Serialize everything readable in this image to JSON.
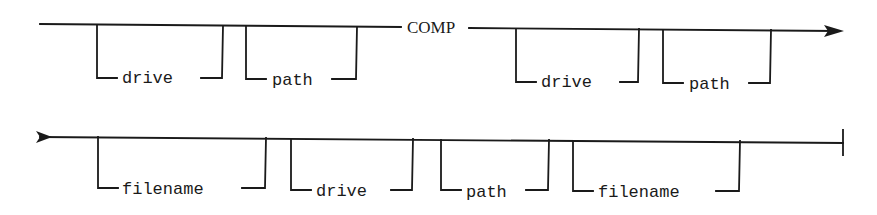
{
  "diagram": {
    "type": "syntax-railroad",
    "command": "COMP",
    "rows": [
      {
        "name": "row-1",
        "start": "line-start",
        "end": "continuation-arrow",
        "elements": [
          {
            "kind": "optional",
            "label": "drive"
          },
          {
            "kind": "optional",
            "label": "path"
          },
          {
            "kind": "keyword",
            "label": "COMP"
          },
          {
            "kind": "optional",
            "label": "drive"
          },
          {
            "kind": "optional",
            "label": "path"
          }
        ]
      },
      {
        "name": "row-2",
        "start": "continuation-arrow",
        "end": "terminator-bar",
        "elements": [
          {
            "kind": "optional",
            "label": "filename"
          },
          {
            "kind": "optional",
            "label": "drive"
          },
          {
            "kind": "optional",
            "label": "path"
          },
          {
            "kind": "optional",
            "label": "filename"
          }
        ]
      }
    ]
  },
  "labels": {
    "keyword": "COMP",
    "r1_opt1": "drive",
    "r1_opt2": "path",
    "r1_opt3": "drive",
    "r1_opt4": "path",
    "r2_opt1": "filename",
    "r2_opt2": "drive",
    "r2_opt3": "path",
    "r2_opt4": "filename"
  }
}
